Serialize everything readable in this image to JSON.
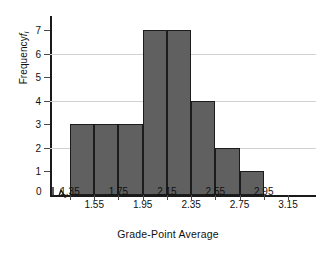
{
  "chart_data": {
    "type": "bar",
    "title": "",
    "xlabel": "Grade-Point Average",
    "ylabel": "Frequency",
    "ylabel_subscript": "i",
    "ylabel_symbol": "f",
    "categories": [
      "1.35-1.55",
      "1.55-1.75",
      "1.75-1.95",
      "1.95-2.15",
      "2.15-2.35",
      "2.35-2.55",
      "2.55-2.75",
      "2.75-2.95"
    ],
    "bin_edges": [
      1.35,
      1.55,
      1.75,
      1.95,
      2.15,
      2.35,
      2.55,
      2.75,
      2.95
    ],
    "values": [
      3,
      3,
      3,
      7,
      7,
      4,
      2,
      1
    ],
    "ylim": [
      0,
      7.6
    ],
    "xlim": [
      1.35,
      3.15
    ],
    "ytick_labels": [
      "0",
      "1",
      "2",
      "3",
      "4",
      "5",
      "6",
      "7"
    ],
    "ytick_values": [
      0,
      1,
      2,
      3,
      4,
      5,
      6,
      7
    ],
    "gridline_values": [
      2,
      4,
      6
    ],
    "grid": true,
    "legend": "none",
    "axis_break": true,
    "origin_label": "0",
    "xtick_labels": [
      "1.35",
      "1.55",
      "1.75",
      "1.95",
      "2.15",
      "2.35",
      "2.55",
      "2.75",
      "2.95",
      "3.15"
    ],
    "xtick_values": [
      1.35,
      1.55,
      1.75,
      1.95,
      2.15,
      2.35,
      2.55,
      2.75,
      2.95,
      3.15
    ],
    "xtick_rows": [
      0,
      1,
      0,
      1,
      0,
      1,
      0,
      1,
      0,
      1
    ],
    "bar_color": "#606060",
    "bar_edge_color": "#1c1c1c",
    "grid_color": "#d2d2d2",
    "axis_color": "#1a1a1a",
    "background": "#ffffff"
  }
}
